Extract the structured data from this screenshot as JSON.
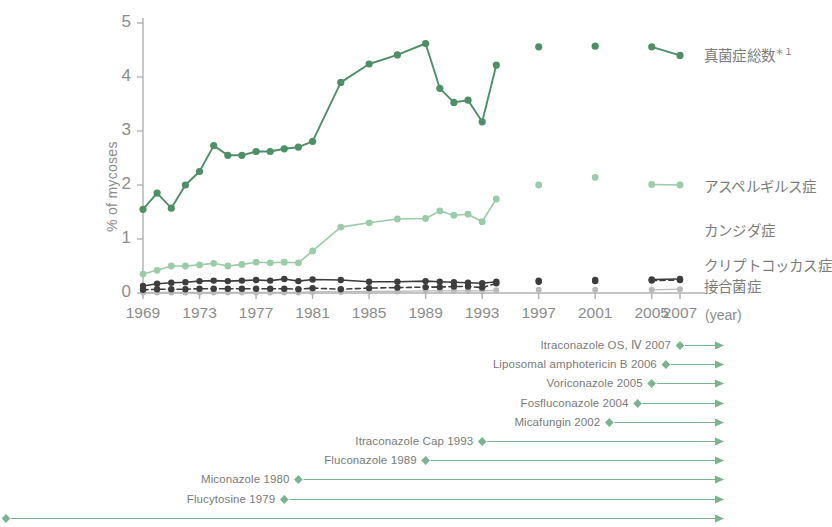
{
  "chart_data": {
    "type": "line",
    "title": "",
    "xlabel": "(year)",
    "ylabel": "% of mycoses",
    "xlim": [
      1969,
      2007
    ],
    "ylim": [
      0,
      5
    ],
    "yticks": [
      "0",
      "1",
      "2",
      "3",
      "4",
      "5"
    ],
    "xticks": [
      "1969",
      "1973",
      "1977",
      "1981",
      "1985",
      "1989",
      "1993",
      "1997",
      "2001",
      "2005",
      "2007"
    ],
    "x": [
      1969,
      1970,
      1971,
      1972,
      1973,
      1974,
      1975,
      1976,
      1977,
      1978,
      1979,
      1980,
      1981,
      1983,
      1985,
      1987,
      1989,
      1990,
      1991,
      1992,
      1993,
      1994,
      1995,
      1997,
      1999,
      2001,
      2003,
      2005,
      2007
    ],
    "grid": false,
    "legend_position": "right",
    "series": [
      {
        "name": "真菌症総数",
        "name_sup": "＊１",
        "color": "#4e8f68",
        "style": "solid",
        "values": [
          1.55,
          1.85,
          1.57,
          2.0,
          2.25,
          2.73,
          2.55,
          2.55,
          2.62,
          2.62,
          2.67,
          2.7,
          2.81,
          3.9,
          4.24,
          4.41,
          4.62,
          3.79,
          3.53,
          3.57,
          3.17,
          4.22,
          null,
          4.56,
          null,
          4.57,
          null,
          4.56,
          4.4
        ]
      },
      {
        "name": "アスペルギルス症",
        "color": "#9bcbaa",
        "style": "solid",
        "values": [
          0.35,
          0.42,
          0.5,
          0.5,
          0.52,
          0.55,
          0.5,
          0.53,
          0.57,
          0.56,
          0.57,
          0.56,
          0.78,
          1.22,
          1.3,
          1.37,
          1.38,
          1.52,
          1.44,
          1.46,
          1.32,
          1.74,
          null,
          2.0,
          null,
          2.14,
          null,
          2.01,
          2.0
        ]
      },
      {
        "name": "カンジダ症",
        "color": "#3d3d3d",
        "style": "solid",
        "values": [
          0.13,
          0.17,
          0.19,
          0.2,
          0.22,
          0.23,
          0.22,
          0.23,
          0.24,
          0.23,
          0.26,
          0.22,
          0.25,
          0.24,
          0.21,
          0.21,
          0.22,
          0.21,
          0.2,
          0.19,
          0.18,
          0.21,
          null,
          0.23,
          null,
          0.24,
          null,
          0.25,
          0.26
        ]
      },
      {
        "name": "クリプトコッカス症",
        "color": "#3d3d3d",
        "style": "dashed",
        "values": [
          0.06,
          0.07,
          0.07,
          0.07,
          0.08,
          0.08,
          0.08,
          0.08,
          0.08,
          0.08,
          0.08,
          0.07,
          0.09,
          0.07,
          0.09,
          0.1,
          0.11,
          0.11,
          0.12,
          0.12,
          0.1,
          0.18,
          null,
          0.21,
          null,
          0.22,
          null,
          0.23,
          0.24
        ]
      },
      {
        "name": "接合菌症",
        "color": "#b9b9b9",
        "style": "solid",
        "values": [
          0.01,
          0.01,
          0.01,
          0.01,
          0.01,
          0.01,
          0.01,
          0.01,
          0.01,
          0.01,
          0.01,
          0.01,
          0.02,
          0.02,
          0.03,
          0.03,
          0.04,
          0.04,
          0.04,
          0.04,
          0.04,
          0.05,
          null,
          0.06,
          null,
          0.06,
          null,
          0.06,
          0.07
        ]
      }
    ]
  },
  "legend": [
    {
      "label": "真菌症総数",
      "sup": "＊１",
      "marker": "dot",
      "color": "#4e8f68"
    },
    {
      "label": "アスペルギルス症",
      "sup": "",
      "marker": "dot",
      "color": "#9bcbaa"
    },
    {
      "label": "カンジダ症",
      "sup": "",
      "marker": "none",
      "color": "#3d3d3d"
    },
    {
      "label": "クリプトコッカス症",
      "sup": "",
      "marker": "none",
      "color": "#3d3d3d"
    },
    {
      "label": "接合菌症",
      "sup": "",
      "marker": "dot",
      "color": "#3d3d3d"
    }
  ],
  "timeline": {
    "color": "#79b38f",
    "entries": [
      {
        "label": "Itraconazole OS, Ⅳ 2007",
        "year": 2007
      },
      {
        "label": "Liposomal amphotericin B 2006",
        "year": 2006
      },
      {
        "label": "Voriconazole 2005",
        "year": 2005
      },
      {
        "label": "Fosfluconazole 2004",
        "year": 2004
      },
      {
        "label": "Micafungin 2002",
        "year": 2002
      },
      {
        "label": "Itraconazole Cap 1993",
        "year": 1993
      },
      {
        "label": "Fluconazole 1989",
        "year": 1989
      },
      {
        "label": "Miconazole 1980",
        "year": 1980
      },
      {
        "label": "Flucytosine 1979",
        "year": 1979
      },
      {
        "label": "Amphotericin B 1952",
        "year": 1952
      }
    ]
  }
}
